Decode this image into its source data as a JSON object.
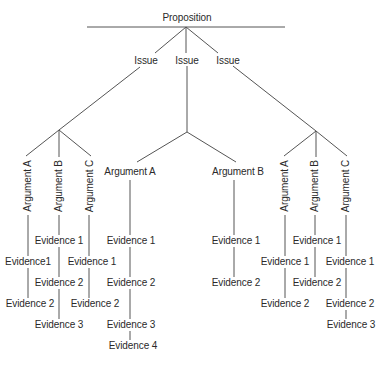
{
  "diagram": {
    "type": "tree",
    "line_color": "#555555",
    "text_color": "#2a2a2a",
    "root": {
      "label": "Proposition"
    },
    "issues": [
      {
        "label": "Issue"
      },
      {
        "label": "Issue"
      },
      {
        "label": "Issue"
      }
    ],
    "branches": [
      {
        "issue_index": 0,
        "arguments": [
          {
            "label": "Argument A",
            "evidence": [
              "Evidence1",
              "Evidence 2"
            ]
          },
          {
            "label": "Argument B",
            "evidence": [
              "Evidence 1",
              "Evidence 2",
              "Evidence 3"
            ]
          },
          {
            "label": "Argument C",
            "evidence": [
              "Evidence 1",
              "Evidence 2"
            ]
          }
        ]
      },
      {
        "issue_index": 1,
        "arguments": [
          {
            "label": "Argument A",
            "evidence": [
              "Evidence 1",
              "Evidence 2",
              "Evidence 3",
              "Evidence 4"
            ]
          },
          {
            "label": "Argument B",
            "evidence": [
              "Evidence 1",
              "Evidence 2"
            ]
          }
        ]
      },
      {
        "issue_index": 2,
        "arguments": [
          {
            "label": "Argument A",
            "evidence": [
              "Evidence 1",
              "Evidence 2"
            ]
          },
          {
            "label": "Argument B",
            "evidence": [
              "Evidence 1",
              "Evidence 2"
            ]
          },
          {
            "label": "Argument C",
            "evidence": [
              "Evidence 1",
              "Evidence 2",
              "Evidence 3"
            ]
          }
        ]
      }
    ]
  }
}
